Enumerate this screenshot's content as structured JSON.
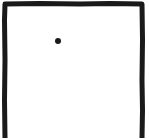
{
  "drawing": {
    "subject": "door",
    "style": "hand-drawn sketch",
    "stroke_color": "#1a1a1a",
    "background_color": "#ffffff",
    "frame": {
      "sides": [
        "left",
        "top",
        "right"
      ],
      "open_bottom": true,
      "stroke_width": 5
    },
    "knob": {
      "x": 58,
      "y": 41,
      "radius": 3
    }
  }
}
